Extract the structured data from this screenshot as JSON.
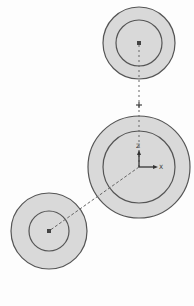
{
  "colors": {
    "background": "#fdfdfd",
    "ring_fill": "#d9d9d9",
    "ring_stroke": "#555555",
    "center_dot": "#444444",
    "dash_line": "#666666",
    "axis": "#333333"
  },
  "circles": [
    {
      "name": "top-circle",
      "cx": 139,
      "cy": 43,
      "outer_r": 36,
      "inner_r": 23
    },
    {
      "name": "middle-circle",
      "cx": 139,
      "cy": 167,
      "outer_r": 51,
      "inner_r": 36
    },
    {
      "name": "bottom-circle",
      "cx": 49,
      "cy": 231,
      "outer_r": 38,
      "inner_r": 20
    }
  ],
  "axes": {
    "origin": {
      "x": 139,
      "y": 167
    },
    "z_label": "Z",
    "x_label": "X"
  },
  "plus_marker": {
    "x": 139,
    "y": 105
  }
}
